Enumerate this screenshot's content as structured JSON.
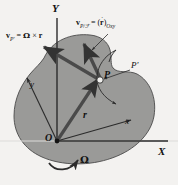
{
  "figure": {
    "background_color": "#f3f2f0",
    "body_fill": "#9a9a98",
    "body_stroke": "#4a4a4a",
    "line_color": "#2b2b2b"
  },
  "axes": {
    "Y_label": "Y",
    "X_label": "X",
    "x_lower_label": "x",
    "y_lower_label": "y"
  },
  "points": {
    "origin_label": "O",
    "P_label": "P",
    "P_prime_label": "P'"
  },
  "vectors": {
    "r_label": "r",
    "omega_label": "Ω",
    "vP_prime": {
      "v": "v",
      "sub": "P'",
      "equals": "=",
      "omega": "Ω",
      "cross": "×",
      "r": "r"
    },
    "vP_rel": {
      "v": "v",
      "sub": "P/ℱ",
      "equals": "=",
      "open": "(",
      "rdot": "r",
      "dot": "·",
      "close": ")",
      "sub2": "Oxy"
    }
  }
}
